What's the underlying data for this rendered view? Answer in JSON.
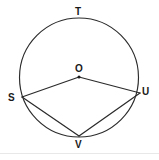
{
  "figure": {
    "type": "circle-geometry-diagram",
    "background_color": "#ffffff",
    "stroke_color": "#2b2b2b",
    "label_color": "#1a1a1a",
    "canvas": {
      "width": 159,
      "height": 160
    },
    "circle": {
      "center": {
        "x": 79,
        "y": 77.5
      },
      "radius": 59.5,
      "label": "circle-O"
    },
    "points": [
      {
        "id": "T",
        "label": "T",
        "x": 79,
        "y": 18,
        "label_x": 75,
        "label_y": 7,
        "on_circle": true,
        "marker": false
      },
      {
        "id": "O",
        "label": "O",
        "x": 79,
        "y": 77,
        "label_x": 75,
        "label_y": 64,
        "on_circle": false,
        "marker": true
      },
      {
        "id": "S",
        "label": "S",
        "x": 22,
        "y": 97,
        "label_x": 8,
        "label_y": 93,
        "on_circle": true,
        "marker": false
      },
      {
        "id": "U",
        "label": "U",
        "x": 140,
        "y": 93,
        "label_x": 142,
        "label_y": 87,
        "on_circle": true,
        "marker": false
      },
      {
        "id": "V",
        "label": "V",
        "x": 79,
        "y": 136,
        "label_x": 75,
        "label_y": 140,
        "on_circle": true,
        "marker": false
      }
    ],
    "segments": [
      {
        "id": "OS",
        "from": "O",
        "to": "S",
        "kind": "radius"
      },
      {
        "id": "OU",
        "from": "O",
        "to": "U",
        "kind": "radius"
      },
      {
        "id": "SV",
        "from": "S",
        "to": "V",
        "kind": "chord"
      },
      {
        "id": "UV",
        "from": "U",
        "to": "V",
        "kind": "chord"
      }
    ],
    "border": {
      "visible_bottom_rule": true,
      "color": "#e8e8e8"
    }
  }
}
